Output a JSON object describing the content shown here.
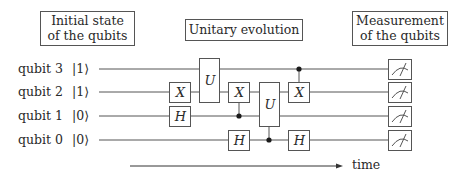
{
  "headers": {
    "initial": [
      "Initial state",
      "of the qubits"
    ],
    "unitary": "Unitary evolution",
    "measurement": [
      "Measurement",
      "of the qubits"
    ]
  },
  "qubits": [
    {
      "label": "qubit 3",
      "ket": "|1⟩"
    },
    {
      "label": "qubit 2",
      "ket": "|1⟩"
    },
    {
      "label": "qubit 1",
      "ket": "|0⟩"
    },
    {
      "label": "qubit 0",
      "ket": "|0⟩"
    }
  ],
  "gates": [
    {
      "type": "X",
      "target": "qubit 2",
      "column": 1
    },
    {
      "type": "H",
      "target": "qubit 1",
      "column": 1
    },
    {
      "type": "U",
      "targets": [
        "qubit 3",
        "qubit 2"
      ],
      "column": 2
    },
    {
      "type": "X",
      "target": "qubit 2",
      "control": "qubit 1",
      "column": 3
    },
    {
      "type": "H",
      "target": "qubit 0",
      "column": 3
    },
    {
      "type": "U",
      "targets": [
        "qubit 2",
        "qubit 1"
      ],
      "control": "qubit 0",
      "column": 4
    },
    {
      "type": "X",
      "target": "qubit 2",
      "control": "qubit 3",
      "column": 5
    },
    {
      "type": "H",
      "target": "qubit 0",
      "column": 5
    }
  ],
  "gate_labels": {
    "x": "X",
    "h": "H",
    "u": "U"
  },
  "measurement_icon": "meter-icon",
  "axis": {
    "label": "time"
  },
  "colors": {
    "line": "#555555",
    "text": "#2a2a2a",
    "background": "#ffffff"
  }
}
